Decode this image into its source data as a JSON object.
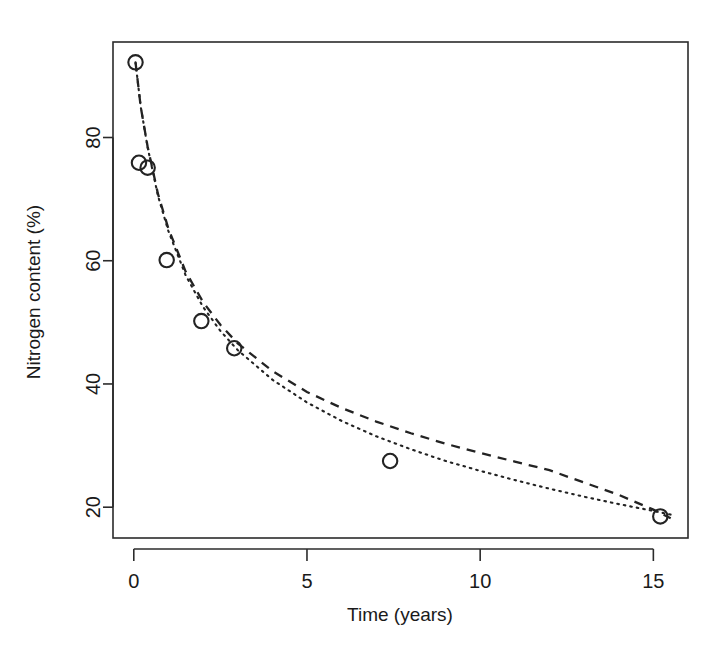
{
  "chart_data": {
    "type": "scatter",
    "title": "",
    "xlabel": "Time (years)",
    "ylabel": "Nitrogen content (%)",
    "xlim": [
      -0.6,
      16.0
    ],
    "ylim": [
      15.0,
      95.5
    ],
    "xticks": [
      0,
      5,
      10,
      15
    ],
    "xticklabels": [
      "0",
      "5",
      "10",
      "15"
    ],
    "yticks": [
      20,
      40,
      60,
      80
    ],
    "yticklabels": [
      "20",
      "40",
      "60",
      "80"
    ],
    "grid": false,
    "legend": "none",
    "marker": "open-circle",
    "x": [
      0.05,
      0.15,
      0.4,
      0.95,
      1.95,
      2.9,
      7.4,
      15.2
    ],
    "y": [
      92.2,
      75.9,
      75.1,
      60.1,
      50.2,
      45.8,
      27.5,
      18.5
    ],
    "points": [
      {
        "x": 0.05,
        "y": 92.2
      },
      {
        "x": 0.15,
        "y": 75.9
      },
      {
        "x": 0.4,
        "y": 75.1
      },
      {
        "x": 0.95,
        "y": 60.1
      },
      {
        "x": 1.95,
        "y": 50.2
      },
      {
        "x": 2.9,
        "y": 45.8
      },
      {
        "x": 7.4,
        "y": 27.5
      },
      {
        "x": 15.2,
        "y": 18.5
      }
    ],
    "series": [
      {
        "name": "fitted-curve-dashed",
        "linestyle": "dashed",
        "color": "#232323",
        "x": [
          0.05,
          0.2,
          0.4,
          0.7,
          1.0,
          1.5,
          2.0,
          2.5,
          3.0,
          4.0,
          5.0,
          6.0,
          7.0,
          8.0,
          9.0,
          10.0,
          11.0,
          12.0,
          13.0,
          14.0,
          15.0,
          15.5
        ],
        "y": [
          92.2,
          85.0,
          78.5,
          70.8,
          65.2,
          58.2,
          53.3,
          49.6,
          46.6,
          42.1,
          38.7,
          36.1,
          33.9,
          32.0,
          30.3,
          28.8,
          27.4,
          26.0,
          24.0,
          22.0,
          19.6,
          18.2
        ]
      },
      {
        "name": "fitted-curve-dotted",
        "linestyle": "dotted",
        "color": "#232323",
        "x": [
          0.05,
          0.2,
          0.4,
          0.7,
          1.0,
          1.5,
          2.0,
          2.5,
          3.0,
          4.0,
          5.0,
          6.0,
          7.0,
          8.0,
          9.0,
          10.0,
          11.0,
          12.0,
          13.0,
          14.0,
          15.0,
          15.5
        ],
        "y": [
          92.2,
          85.0,
          78.4,
          70.5,
          64.8,
          57.6,
          52.5,
          48.6,
          45.5,
          40.7,
          37.0,
          34.0,
          31.5,
          29.4,
          27.5,
          25.9,
          24.4,
          23.0,
          21.7,
          20.5,
          19.4,
          18.8
        ]
      }
    ],
    "annotations": []
  },
  "figure": {
    "background_color": "#ffffff",
    "foreground_color": "#232323"
  }
}
